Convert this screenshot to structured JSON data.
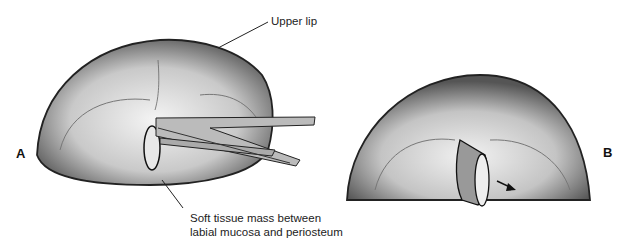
{
  "figure": {
    "panel_a": {
      "letter": "A",
      "callouts": [
        {
          "text": "Upper lip"
        },
        {
          "text_line1": "Soft tissue mass between",
          "text_line2": "labial mucosa and periosteum"
        }
      ]
    },
    "panel_b": {
      "letter": "B"
    }
  }
}
